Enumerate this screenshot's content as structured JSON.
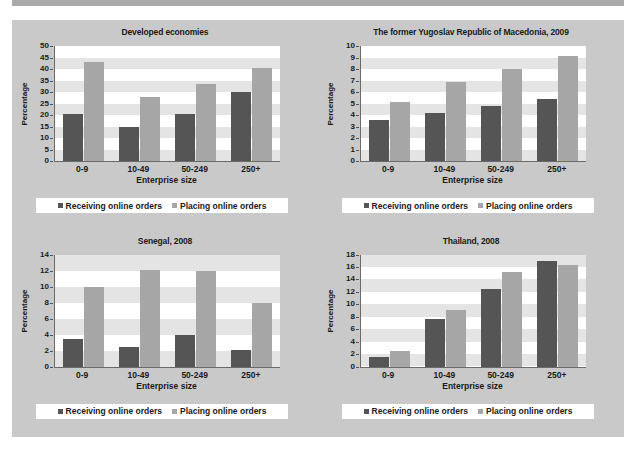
{
  "figure": {
    "caption": "Figure II.20.   Enterprises using the internet to place and receive orders, selected economies, 2008-2009 (%)",
    "axis_x_label": "Enterprise size",
    "axis_y_label": "Percentage",
    "legend": {
      "receiving": "Receiving online orders",
      "placing": "Placing online orders"
    },
    "colors": {
      "receiving": "#555555",
      "placing": "#a6a6a6",
      "panel_background": "#c9c9c9",
      "plot_background": "#ffffff",
      "band": "#e4e4e4",
      "caption_banner": "#a9a9a9"
    }
  },
  "chart_data": [
    {
      "type": "bar",
      "title": "Developed economies",
      "xlabel": "Enterprise size",
      "ylabel": "Percentage",
      "categories": [
        "0-9",
        "10-49",
        "50-249",
        "250+"
      ],
      "ylim": [
        0,
        50
      ],
      "yticks": [
        0,
        5,
        10,
        15,
        20,
        25,
        30,
        35,
        40,
        45,
        50
      ],
      "grid": "horizontal-bands",
      "legend_position": "bottom",
      "series": [
        {
          "name": "Receiving online orders",
          "values": [
            20.5,
            15.0,
            20.5,
            30.0
          ]
        },
        {
          "name": "Placing online orders",
          "values": [
            43.0,
            28.0,
            33.5,
            40.5
          ]
        }
      ]
    },
    {
      "type": "bar",
      "title": "The former Yugoslav Republic of Macedonia, 2009",
      "xlabel": "Enterprise size",
      "ylabel": "Percentage",
      "categories": [
        "0-9",
        "10-49",
        "50-249",
        "250+"
      ],
      "ylim": [
        0,
        10
      ],
      "yticks": [
        0,
        1,
        2,
        3,
        4,
        5,
        6,
        7,
        8,
        9,
        10
      ],
      "grid": "horizontal-bands",
      "legend_position": "bottom",
      "series": [
        {
          "name": "Receiving online orders",
          "values": [
            3.6,
            4.2,
            4.8,
            5.4
          ]
        },
        {
          "name": "Placing online orders",
          "values": [
            5.1,
            6.9,
            8.0,
            9.1
          ]
        }
      ]
    },
    {
      "type": "bar",
      "title": "Senegal, 2008",
      "xlabel": "Enterprise size",
      "ylabel": "Percentage",
      "categories": [
        "0-9",
        "10-49",
        "50-249",
        "250+"
      ],
      "ylim": [
        0,
        14
      ],
      "yticks": [
        0,
        2,
        4,
        6,
        8,
        10,
        12,
        14
      ],
      "grid": "horizontal-bands",
      "legend_position": "bottom",
      "series": [
        {
          "name": "Receiving online orders",
          "values": [
            3.4,
            2.4,
            3.9,
            2.1
          ]
        },
        {
          "name": "Placing online orders",
          "values": [
            10.0,
            12.1,
            12.0,
            8.0
          ]
        }
      ]
    },
    {
      "type": "bar",
      "title": "Thailand, 2008",
      "xlabel": "Enterprise size",
      "ylabel": "Percentage",
      "categories": [
        "0-9",
        "10-49",
        "50-249",
        "250+"
      ],
      "ylim": [
        0,
        18
      ],
      "yticks": [
        0,
        2,
        4,
        6,
        8,
        10,
        12,
        14,
        16,
        18
      ],
      "grid": "horizontal-bands",
      "legend_position": "bottom",
      "series": [
        {
          "name": "Receiving online orders",
          "values": [
            1.6,
            7.6,
            12.5,
            16.9
          ]
        },
        {
          "name": "Placing online orders",
          "values": [
            2.5,
            9.1,
            15.2,
            16.3
          ]
        }
      ]
    }
  ]
}
